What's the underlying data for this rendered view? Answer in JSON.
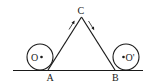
{
  "diagram": {
    "labels": {
      "apex": "C",
      "left_base": "A",
      "right_base": "B",
      "left_circle": "O",
      "right_circle": "O'"
    },
    "arrows": {
      "left": "up-toward-C",
      "right": "down-away-from-C"
    },
    "colors": {
      "ink": "#1a1a1a",
      "background": "#ffffff"
    }
  }
}
